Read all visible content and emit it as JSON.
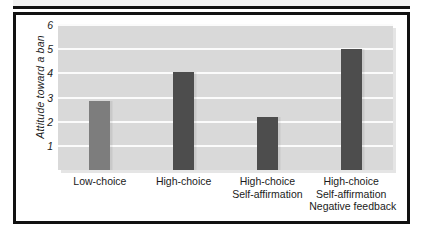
{
  "figure": {
    "frame_color": "#111111",
    "background": "#ffffff",
    "panel_color": "#d9d9d9",
    "gridline_color": "#fbfbfb"
  },
  "chart_data": {
    "type": "bar",
    "title": "",
    "xlabel": "",
    "ylabel": "Attitude toward a ban",
    "categories": [
      "Low-choice",
      "High-choice",
      "High-choice\nSelf-affirmation",
      "High-choice\nSelf-affirmation\nNegative feedback"
    ],
    "category_lines": [
      [
        "Low-choice"
      ],
      [
        "High-choice"
      ],
      [
        "High-choice",
        "Self-affirmation"
      ],
      [
        "High-choice",
        "Self-affirmation",
        "Negative feedback"
      ]
    ],
    "values": [
      2.85,
      4.05,
      2.2,
      5.0
    ],
    "bar_colors": [
      "#7d7d7d",
      "#4d4d4d",
      "#4d4d4d",
      "#4d4d4d"
    ],
    "ylim": [
      0,
      6
    ],
    "yticks": [
      1,
      2,
      3,
      4,
      5,
      6
    ],
    "ytick_labels": [
      "1",
      "2",
      "3",
      "4",
      "5",
      "6"
    ],
    "grid": true,
    "grid_axis": "y",
    "legend": null,
    "legend_position": "none"
  }
}
